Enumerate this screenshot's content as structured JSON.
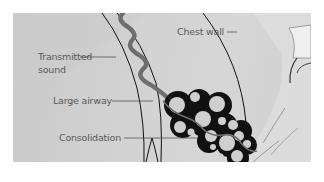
{
  "figure": {
    "background_color": "#d0d0d0",
    "labels": {
      "chest_wall": "Chest wall",
      "transmitted_sound_line1": "Transmitted",
      "transmitted_sound_line2": "sound",
      "large_airway": "Large airway",
      "consolidation": "Consolidation"
    },
    "colors": {
      "outline": "#111111",
      "sound_wave": "#6e6e6e",
      "alveoli_fill": "#cfcfcf",
      "label_text": "#595959"
    }
  }
}
